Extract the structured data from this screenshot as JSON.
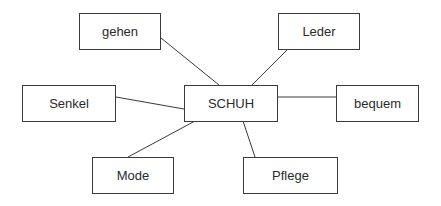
{
  "diagram": {
    "type": "mind-map",
    "center": {
      "id": "schuh",
      "label": "SCHUH"
    },
    "nodes": [
      {
        "id": "gehen",
        "label": "gehen"
      },
      {
        "id": "leder",
        "label": "Leder"
      },
      {
        "id": "senkel",
        "label": "Senkel"
      },
      {
        "id": "schuh",
        "label": "SCHUH"
      },
      {
        "id": "bequem",
        "label": "bequem"
      },
      {
        "id": "mode",
        "label": "Mode"
      },
      {
        "id": "pflege",
        "label": "Pflege"
      }
    ],
    "edges": [
      [
        "schuh",
        "gehen"
      ],
      [
        "schuh",
        "leder"
      ],
      [
        "schuh",
        "senkel"
      ],
      [
        "schuh",
        "bequem"
      ],
      [
        "schuh",
        "mode"
      ],
      [
        "schuh",
        "pflege"
      ]
    ],
    "colors": {
      "stroke": "#3a3a3a",
      "text": "#2b2b2b",
      "background": "#ffffff"
    }
  }
}
